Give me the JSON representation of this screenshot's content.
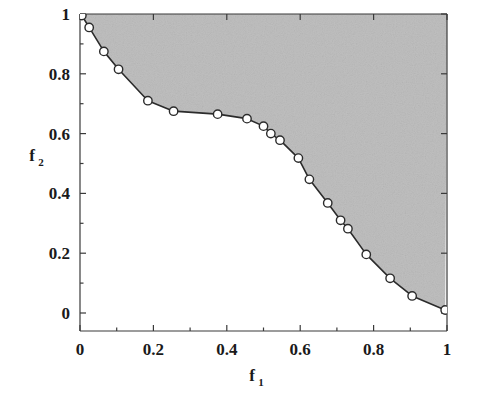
{
  "chart_data": {
    "type": "line",
    "title": "",
    "subtitle": "",
    "xlabel": "f",
    "xlabel_sub": "1",
    "ylabel": "f",
    "ylabel_sub": "2",
    "xlim": [
      0,
      1
    ],
    "ylim": [
      0,
      1
    ],
    "grid": false,
    "legend": null,
    "legend_position": "none",
    "xticks": [
      0,
      0.2,
      0.4,
      0.6,
      0.8,
      1
    ],
    "xticklabels": [
      "0",
      "0.2",
      "0.4",
      "0.6",
      "0.8",
      "1"
    ],
    "yticks": [
      0,
      0.2,
      0.4,
      0.6,
      0.8,
      1
    ],
    "yticklabels": [
      "0",
      "0.2",
      "0.4",
      "0.6",
      "0.8",
      "1"
    ],
    "xminorticks": [
      0.1,
      0.3,
      0.5,
      0.7,
      0.9
    ],
    "yminorticks": [
      0.1,
      0.3,
      0.5,
      0.7,
      0.9
    ],
    "shaded_region": {
      "description": "dominated-region-above-pareto-front",
      "color": "#bfbfbf"
    },
    "marker_style": {
      "shape": "circle",
      "face_color": "#ffffff",
      "edge_color": "#2b2b2b"
    },
    "line_color": "#2b2b2b",
    "series": [
      {
        "name": "pareto-front",
        "x": [
          0.005,
          0.025,
          0.065,
          0.105,
          0.185,
          0.255,
          0.375,
          0.455,
          0.5,
          0.52,
          0.545,
          0.595,
          0.625,
          0.675,
          0.71,
          0.73,
          0.78,
          0.845,
          0.905,
          0.995
        ],
        "y": [
          0.995,
          0.955,
          0.875,
          0.815,
          0.71,
          0.675,
          0.665,
          0.65,
          0.625,
          0.6,
          0.578,
          0.518,
          0.447,
          0.368,
          0.31,
          0.282,
          0.196,
          0.116,
          0.057,
          0.01
        ]
      }
    ]
  },
  "figure": {
    "background": "#ffffff",
    "frame_color": "#3a3a3a"
  }
}
